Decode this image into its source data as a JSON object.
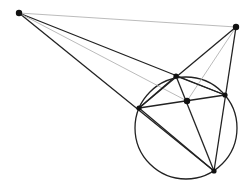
{
  "diagram": {
    "type": "geometry-construction",
    "colors": {
      "dark": "#222222",
      "light": "#aaaaaa",
      "point": "#111111",
      "background": "#ffffff"
    },
    "points": {
      "A": [
        19,
        13
      ],
      "B": [
        236,
        27
      ],
      "C": [
        176,
        76
      ],
      "P": [
        139,
        108
      ],
      "R": [
        225,
        95
      ],
      "Q": [
        214,
        171
      ],
      "M": [
        187,
        101
      ]
    },
    "circle": {
      "cx": 186,
      "cy": 128,
      "r": 51
    },
    "segments": [
      {
        "from": "A",
        "to": "B",
        "style": "light"
      },
      {
        "from": "A",
        "to": "R",
        "style": "dark"
      },
      {
        "from": "A",
        "to": "Q",
        "style": "dark"
      },
      {
        "from": "A",
        "to": "M",
        "style": "light"
      },
      {
        "from": "B",
        "to": "P",
        "style": "dark"
      },
      {
        "from": "B",
        "to": "Q",
        "style": "dark"
      },
      {
        "from": "B",
        "to": "M",
        "style": "light"
      },
      {
        "from": "C",
        "to": "P",
        "style": "dark"
      },
      {
        "from": "C",
        "to": "R",
        "style": "dark"
      },
      {
        "from": "C",
        "to": "Q",
        "style": "dark"
      },
      {
        "from": "P",
        "to": "R",
        "style": "dark"
      },
      {
        "from": "P",
        "to": "Q",
        "style": "dark"
      }
    ]
  }
}
